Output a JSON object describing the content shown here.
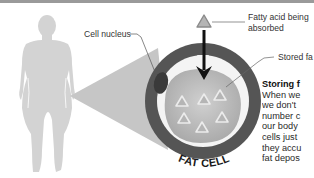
{
  "diagram": {
    "title": "FAT CELL",
    "labels": {
      "nucleus": "Cell nucleus",
      "fatty_acid_line1": "Fatty acid being",
      "fatty_acid_line2": "absorbed",
      "stored_fat": "Stored fa"
    },
    "side_text": {
      "heading": "Storing f",
      "lines": [
        "When we",
        "we don't",
        "number c",
        "our body",
        "cells just ",
        "they accu",
        "fat depos"
      ]
    },
    "colors": {
      "silhouette": "#d3d3d3",
      "wedge": "#c6c6c6",
      "outer_ring": "#555555",
      "inner_ring": "#f4f4f4",
      "fat_droplet": "#bdbdbd",
      "nucleus": "#3a3a3a",
      "arrow": "#111111",
      "triangle_fill": "#b5b5b5",
      "triangle_stroke": "#ececec",
      "top_bar": "#9a9a9a"
    }
  }
}
